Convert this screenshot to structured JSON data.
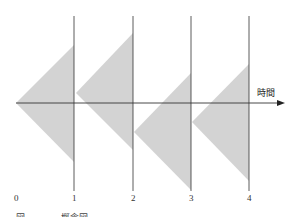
{
  "diagram": {
    "axis_label": "時間",
    "tick_labels": [
      "0",
      "1",
      "2",
      "3",
      "4"
    ],
    "caption_partial": "図——　　概念図",
    "colors": {
      "triangle_fill": "#d3d3d3",
      "line": "#333333",
      "background": "#ffffff"
    },
    "triangles": [
      {
        "apex": [
          16,
          103
        ],
        "top": [
          74,
          45
        ],
        "bottom": [
          74,
          162
        ]
      },
      {
        "apex": [
          76,
          93
        ],
        "top": [
          133,
          33
        ],
        "bottom": [
          133,
          150
        ]
      },
      {
        "apex": [
          134,
          132
        ],
        "top": [
          191,
          73
        ],
        "bottom": [
          191,
          190
        ]
      },
      {
        "apex": [
          192,
          122
        ],
        "top": [
          249,
          64
        ],
        "bottom": [
          249,
          181
        ]
      }
    ],
    "vertical_lines_x": [
      74,
      133,
      191,
      249
    ]
  }
}
